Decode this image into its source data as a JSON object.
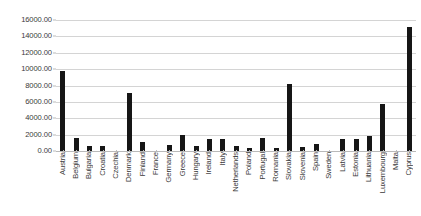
{
  "chart_data": {
    "type": "bar",
    "title": "",
    "subtitle": "",
    "xlabel": "",
    "ylabel": "",
    "ylim": [
      0,
      16000
    ],
    "grid": true,
    "legend": false,
    "y_ticks": [
      "0.00",
      "2000.00",
      "4000.00",
      "6000.00",
      "8000.00",
      "10000.00",
      "12000.00",
      "14000.00",
      "16000.00"
    ],
    "y_tick_values": [
      0,
      2000,
      4000,
      6000,
      8000,
      10000,
      12000,
      14000,
      16000
    ],
    "categories": [
      "Austria",
      "Belgium",
      "Bulgaria",
      "Croatia",
      "Czechia",
      "Denmark",
      "Finland",
      "France",
      "Germany",
      "Greece",
      "Hungary",
      "Ireland",
      "Italy",
      "Netherlands",
      "Poland",
      "Portugal",
      "Romania",
      "Slovakia",
      "Slovenia",
      "Spain",
      "Sweden",
      "Latvia",
      "Estonia",
      "Lithuania",
      "Luxembourg",
      "Malta",
      "Cyprus"
    ],
    "values": [
      9800,
      1620,
      620,
      580,
      0,
      7050,
      1150,
      0,
      680,
      2000,
      560,
      1450,
      1480,
      660,
      320,
      1550,
      420,
      8150,
      520,
      900,
      0,
      1520,
      1480,
      1800,
      5800,
      0,
      15200
    ],
    "bar_color": "#161616",
    "gridline_color": "#d4d4d4",
    "axis_color": "#b9b9b9",
    "background_color": "#ffffff"
  }
}
